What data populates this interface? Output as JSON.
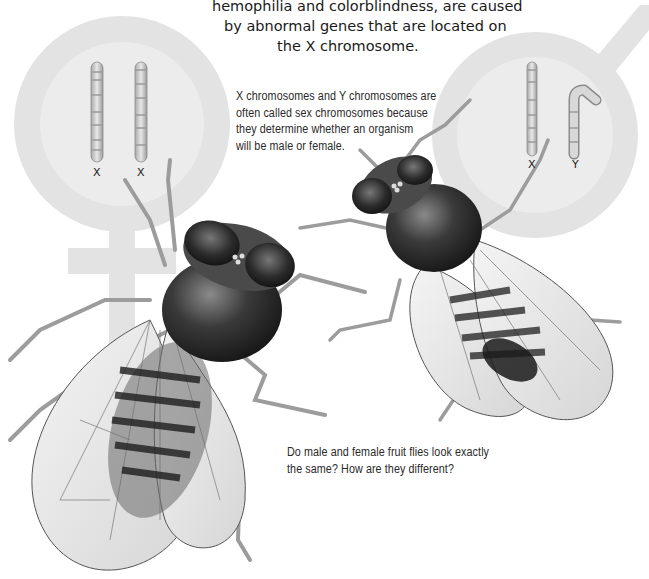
{
  "top_caption": {
    "lines": [
      "hemophilia and colorblindness, are caused",
      "by abnormal genes that are located on",
      "the X chromosome."
    ]
  },
  "sex_chromosome_note": {
    "lines": [
      "X chromosomes and Y chromosomes are",
      "often called sex chromosomes because",
      "they determine whether an organism",
      "will be male or female."
    ]
  },
  "question": {
    "lines": [
      "Do male and female fruit flies look exactly",
      "the same? How are they different?"
    ]
  },
  "female_panel": {
    "symbol": "female-symbol",
    "chromosome_labels": [
      "X",
      "X"
    ]
  },
  "male_panel": {
    "symbol": "male-symbol",
    "chromosome_labels": [
      "X",
      "Y"
    ]
  },
  "illustrations": {
    "left_fly": "female-fruit-fly",
    "right_fly": "male-fruit-fly"
  },
  "colors": {
    "symbol_fill": "#e4e4e4",
    "symbol_inner": "#ececec",
    "text": "#1a1a1a",
    "fly_dark": "#2a2a2a"
  }
}
